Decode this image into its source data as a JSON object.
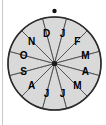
{
  "figure": {
    "name": "month-spinner",
    "background_color": "#ffffff",
    "sector_fill_color": "#d9d9d9",
    "sector_border_color": "#4a4a4a",
    "rim_color": "#2b2b2b",
    "label_color": "#000000",
    "hub_color": "#1a1a1a",
    "pointer_color": "#111111"
  },
  "wheel": {
    "center_x": 54.5,
    "center_y": 63.5,
    "radius": 46.5,
    "sector_count": 12,
    "sector_angle_degrees": 30,
    "rotation_offset_degrees": 15,
    "label_radius": 31
  },
  "pointer": {
    "name": "pointer-dot",
    "x": 54.5,
    "y": 11,
    "radius": 2.2
  },
  "hub": {
    "name": "center-hub",
    "x": 54.5,
    "y": 63.5,
    "radius": 2.6
  },
  "sectors": [
    {
      "index": 1,
      "label": "J",
      "month": "January",
      "start_angle": 0,
      "end_angle": 30,
      "label_x": 62.5,
      "label_y": 33.6
    },
    {
      "index": 2,
      "label": "F",
      "month": "February",
      "start_angle": 30,
      "end_angle": 60,
      "label_x": 77.4,
      "label_y": 41.6
    },
    {
      "index": 3,
      "label": "M",
      "month": "March",
      "start_angle": 60,
      "end_angle": 90,
      "label_x": 85.4,
      "label_y": 55.5
    },
    {
      "index": 4,
      "label": "A",
      "month": "April",
      "start_angle": 90,
      "end_angle": 120,
      "label_x": 85.4,
      "label_y": 71.5
    },
    {
      "index": 5,
      "label": "M",
      "month": "May",
      "start_angle": 120,
      "end_angle": 150,
      "label_x": 77.4,
      "label_y": 85.4
    },
    {
      "index": 6,
      "label": "J",
      "month": "June",
      "start_angle": 150,
      "end_angle": 180,
      "label_x": 62.5,
      "label_y": 93.4
    },
    {
      "index": 7,
      "label": "J",
      "month": "July",
      "start_angle": 180,
      "end_angle": 210,
      "label_x": 46.5,
      "label_y": 93.4
    },
    {
      "index": 8,
      "label": "A",
      "month": "August",
      "start_angle": 210,
      "end_angle": 240,
      "label_x": 31.6,
      "label_y": 85.4
    },
    {
      "index": 9,
      "label": "S",
      "month": "September",
      "start_angle": 240,
      "end_angle": 270,
      "label_x": 23.6,
      "label_y": 71.5
    },
    {
      "index": 10,
      "label": "O",
      "month": "October",
      "start_angle": 270,
      "end_angle": 300,
      "label_x": 23.6,
      "label_y": 55.5
    },
    {
      "index": 11,
      "label": "N",
      "month": "November",
      "start_angle": 300,
      "end_angle": 330,
      "label_x": 31.6,
      "label_y": 41.6
    },
    {
      "index": 12,
      "label": "D",
      "month": "December",
      "start_angle": 330,
      "end_angle": 360,
      "label_x": 46.5,
      "label_y": 33.6
    }
  ]
}
